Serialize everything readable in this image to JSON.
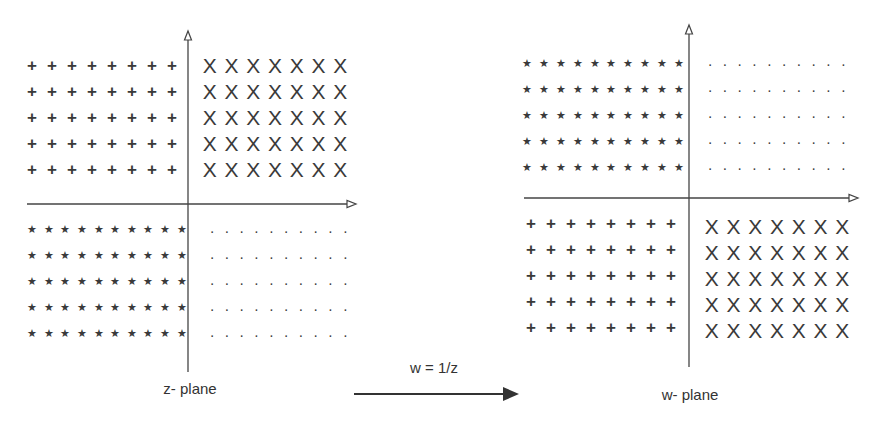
{
  "diagram": {
    "mapping_label": "w = 1/z",
    "z_plane": {
      "label": "z- plane",
      "quadrants": {
        "top_left": {
          "symbol": "+",
          "rows": 5,
          "cols": 8
        },
        "top_right": {
          "symbol": "X",
          "rows": 5,
          "cols": 7
        },
        "bottom_left": {
          "symbol": "*",
          "rows": 5,
          "cols": 10
        },
        "bottom_right": {
          "symbol": ".",
          "rows": 5,
          "cols": 10
        }
      }
    },
    "w_plane": {
      "label": "w- plane",
      "quadrants": {
        "top_left": {
          "symbol": "*",
          "rows": 5,
          "cols": 10
        },
        "top_right": {
          "symbol": ".",
          "rows": 5,
          "cols": 10
        },
        "bottom_left": {
          "symbol": "+",
          "rows": 5,
          "cols": 8
        },
        "bottom_right": {
          "symbol": "X",
          "rows": 5,
          "cols": 7
        }
      }
    },
    "colors": {
      "ink": "#333333",
      "background": "#ffffff"
    }
  }
}
